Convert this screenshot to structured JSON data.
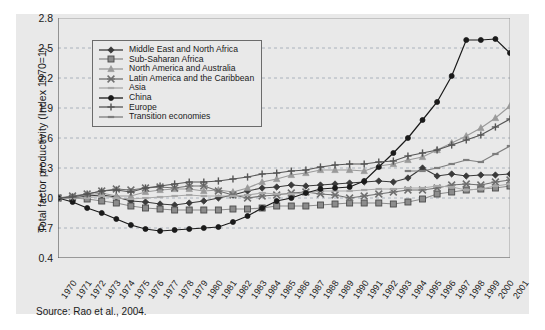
{
  "figure": {
    "background": "#e9e9e9",
    "source_note": "Source: Rao et al., 2004."
  },
  "chart_data": {
    "type": "line",
    "title": "",
    "xlabel": "",
    "ylabel": "Total factor productivity (Index 1970=1)",
    "ylim": [
      0.4,
      2.8
    ],
    "yticks": [
      "0.4",
      "0.7",
      "1.0",
      "1.3",
      "1.6",
      "1.9",
      "2.2",
      "2.5",
      "2.8"
    ],
    "ytick_values": [
      0.4,
      0.7,
      1.0,
      1.3,
      1.6,
      1.9,
      2.2,
      2.5,
      2.8
    ],
    "grid": true,
    "grid_style": "dashed-horizontal",
    "legend_position": "upper-left-inset",
    "x": [
      1970,
      1971,
      1972,
      1973,
      1974,
      1975,
      1976,
      1977,
      1978,
      1979,
      1980,
      1981,
      1982,
      1983,
      1984,
      1985,
      1986,
      1987,
      1988,
      1989,
      1990,
      1991,
      1992,
      1993,
      1994,
      1995,
      1996,
      1997,
      1998,
      1999,
      2000,
      2001
    ],
    "categories": [
      "1970",
      "1971",
      "1972",
      "1973",
      "1974",
      "1975",
      "1976",
      "1977",
      "1978",
      "1979",
      "1980",
      "1981",
      "1982",
      "1983",
      "1984",
      "1985",
      "1986",
      "1987",
      "1988",
      "1989",
      "1990",
      "1991",
      "1992",
      "1993",
      "1994",
      "1995",
      "1996",
      "1997",
      "1998",
      "1999",
      "2000",
      "2001"
    ],
    "series": [
      {
        "name": "Middle East and North Africa",
        "color": "#3a3a3a",
        "marker": "diamond",
        "values": [
          1.0,
          1.0,
          1.02,
          1.03,
          1.01,
          0.97,
          0.96,
          0.94,
          0.93,
          0.95,
          0.97,
          1.0,
          1.03,
          1.07,
          1.1,
          1.11,
          1.13,
          1.12,
          1.13,
          1.14,
          1.15,
          1.16,
          1.17,
          1.16,
          1.2,
          1.3,
          1.22,
          1.24,
          1.22,
          1.23,
          1.23,
          1.24
        ]
      },
      {
        "name": "Sub-Saharan Africa",
        "color": "#8c8c8c",
        "marker": "square",
        "values": [
          1.0,
          1.0,
          0.99,
          0.97,
          0.95,
          0.92,
          0.9,
          0.89,
          0.88,
          0.88,
          0.88,
          0.88,
          0.89,
          0.89,
          0.9,
          0.92,
          0.92,
          0.92,
          0.93,
          0.94,
          0.95,
          0.95,
          0.95,
          0.94,
          0.96,
          0.99,
          1.04,
          1.06,
          1.08,
          1.09,
          1.1,
          1.12
        ]
      },
      {
        "name": "North America and Australia",
        "color": "#9a9a9a",
        "marker": "triangle",
        "values": [
          1.0,
          1.01,
          1.03,
          1.05,
          1.02,
          1.02,
          1.06,
          1.08,
          1.09,
          1.09,
          1.07,
          1.08,
          1.06,
          1.1,
          1.16,
          1.19,
          1.23,
          1.25,
          1.28,
          1.28,
          1.28,
          1.27,
          1.32,
          1.34,
          1.38,
          1.41,
          1.48,
          1.55,
          1.62,
          1.7,
          1.8,
          1.92
        ]
      },
      {
        "name": "Latin America and the Caribbean",
        "color": "#6f6f6f",
        "marker": "x-cross",
        "values": [
          1.0,
          1.02,
          1.04,
          1.07,
          1.09,
          1.08,
          1.1,
          1.11,
          1.1,
          1.12,
          1.12,
          1.07,
          1.03,
          1.0,
          1.02,
          1.03,
          1.05,
          1.06,
          1.04,
          1.03,
          1.0,
          1.02,
          1.04,
          1.06,
          1.08,
          1.08,
          1.1,
          1.13,
          1.14,
          1.13,
          1.16,
          1.18
        ]
      },
      {
        "name": "Asia",
        "color": "#a8a8a8",
        "marker": "dash",
        "values": [
          1.0,
          1.0,
          1.0,
          1.02,
          1.0,
          0.99,
          1.0,
          1.01,
          1.02,
          1.03,
          1.02,
          1.02,
          1.02,
          1.03,
          1.05,
          1.04,
          1.04,
          1.05,
          1.07,
          1.07,
          1.07,
          1.08,
          1.09,
          1.09,
          1.1,
          1.1,
          1.12,
          1.11,
          1.08,
          1.09,
          1.12,
          1.14
        ]
      },
      {
        "name": "China",
        "color": "#1a1a1a",
        "marker": "circle",
        "values": [
          1.0,
          0.96,
          0.9,
          0.85,
          0.79,
          0.73,
          0.69,
          0.67,
          0.68,
          0.69,
          0.7,
          0.71,
          0.76,
          0.82,
          0.9,
          0.97,
          1.0,
          1.05,
          1.09,
          1.1,
          1.11,
          1.17,
          1.31,
          1.45,
          1.6,
          1.78,
          1.96,
          2.22,
          2.58,
          2.58,
          2.59,
          2.45
        ]
      },
      {
        "name": "Europe",
        "color": "#555555",
        "marker": "plus",
        "values": [
          1.0,
          1.01,
          1.04,
          1.07,
          1.08,
          1.06,
          1.1,
          1.12,
          1.14,
          1.16,
          1.16,
          1.17,
          1.19,
          1.21,
          1.24,
          1.25,
          1.27,
          1.28,
          1.31,
          1.33,
          1.34,
          1.34,
          1.36,
          1.37,
          1.42,
          1.45,
          1.48,
          1.53,
          1.58,
          1.63,
          1.71,
          1.79
        ]
      },
      {
        "name": "Transition economies",
        "color": "#7d7d7d",
        "marker": "dash",
        "values": [
          null,
          null,
          null,
          null,
          null,
          null,
          null,
          null,
          null,
          null,
          null,
          null,
          null,
          null,
          null,
          null,
          null,
          null,
          null,
          null,
          null,
          null,
          null,
          null,
          1.27,
          1.27,
          1.3,
          1.34,
          1.38,
          1.36,
          1.44,
          1.52
        ]
      }
    ]
  }
}
